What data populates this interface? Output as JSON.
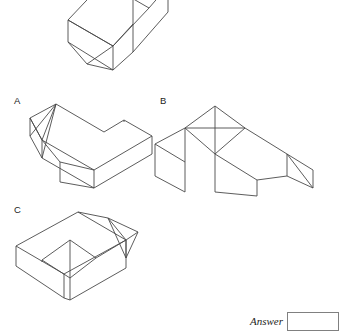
{
  "page": {
    "type": "spatial-reasoning-question",
    "background_color": "#ffffff",
    "line_color": "#4a4a4a",
    "width": 337,
    "height": 334
  },
  "question_figure": {
    "name": "question-solid",
    "description": "Isometric 3D block with a chamfered/sloped end, drawn in wireframe outline, cropped at the top edge of the image",
    "caption": ""
  },
  "options": [
    {
      "letter": "A",
      "name": "option-a",
      "description": "Isometric L-shaped block with a chamfered corner at the near-left end"
    },
    {
      "letter": "B",
      "name": "option-b",
      "description": "Isometric T / cross shaped block made of a cube joined to a long bar with a sloped end"
    },
    {
      "letter": "C",
      "name": "option-c",
      "description": "Isometric stepped block with a wedge notch on its top face and a chamfered far end"
    }
  ],
  "answer": {
    "label": "Answer",
    "value": "",
    "placeholder": ""
  },
  "colors": {
    "stroke": "#4a4a4a",
    "box_border": "#808080",
    "text": "#1d1d1d",
    "background": "#ffffff"
  }
}
